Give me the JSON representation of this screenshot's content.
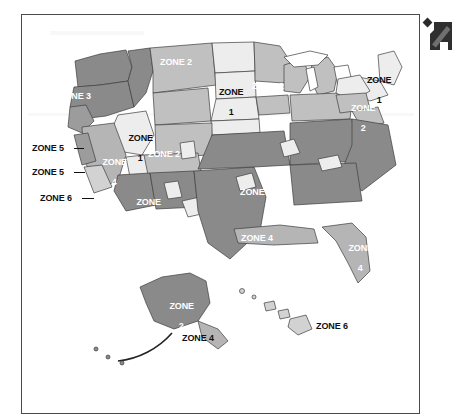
{
  "panel": {
    "border_color": "#4a4a4a",
    "background": "#ffffff"
  },
  "decorations": {
    "corner_marker": "diamond-marker",
    "pointer": "arrow-pointer-icon"
  },
  "legend_palette": {
    "zone_1": "#ededed",
    "zone_2": "#c0c0c0",
    "zone_3": "#8a8a8a",
    "zone_4": "#b5b5b5",
    "zone_5": "#9c9c9c",
    "zone_6": "#d2d2d2",
    "water": "#ffffff",
    "outline": "#3d3d3d"
  },
  "labels": {
    "pacific_northwest": "ZONE 3",
    "northern_plains_upper": "ZONE 2",
    "dakotas": {
      "line1": "ZONE",
      "line2": "1"
    },
    "upper_midwest": "ZONE 2",
    "new_england": {
      "line1": "ZONE",
      "line2": "1"
    },
    "mid_atlantic": {
      "line1": "ZONE",
      "line2": "2"
    },
    "great_basin": {
      "line1": "ZONE",
      "line2": "1"
    },
    "california": {
      "line1": "ZONE",
      "line2": "4"
    },
    "mountain_west": "ZONE 2",
    "southwest": {
      "line1": "ZONE",
      "line2": "3"
    },
    "southeast": "ZONE 3",
    "gulf_coast": "ZONE 4",
    "florida": {
      "line1": "ZONE",
      "line2": "4"
    },
    "coastal_callout_1": "ZONE 5",
    "coastal_callout_2": "ZONE 5",
    "coastal_callout_3": "ZONE 6",
    "alaska": {
      "line1": "ZONE",
      "line2": "2"
    },
    "aleutians": "ZONE 4",
    "hawaii": "ZONE 6"
  }
}
